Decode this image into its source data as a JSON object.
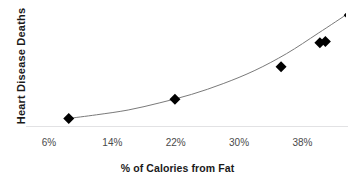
{
  "chart_data": {
    "type": "scatter",
    "title": "",
    "subtitle": "",
    "xlabel": "% of Calories from Fat",
    "ylabel": "Heart Disease Deaths",
    "xtick_labels": [
      "6%",
      "14%",
      "22%",
      "30%",
      "38%"
    ],
    "xtick_values": [
      6,
      14,
      22,
      30,
      38
    ],
    "ytick_labels": [],
    "xlim": [
      3.1,
      43.5
    ],
    "ylim": [
      0,
      100
    ],
    "grid": false,
    "legend": null,
    "legend_position": "none",
    "annotations": [],
    "series": [
      {
        "name": "Countries",
        "marker": "diamond",
        "marker_color": "#000000",
        "marker_size": 11,
        "x": [
          8.5,
          21.9,
          35.3,
          40.2,
          40.9,
          43.9
        ],
        "y": [
          8,
          24,
          51,
          71,
          72,
          94
        ]
      },
      {
        "name": "Fitted trend",
        "type": "line",
        "line_color": "#7a7a7a",
        "line_width": 1,
        "x": [
          8.5,
          12.0,
          16.0,
          20.0,
          24.0,
          28.0,
          32.0,
          36.0,
          40.0,
          43.9
        ],
        "y": [
          8,
          11,
          15,
          21,
          28,
          37,
          48,
          62,
          79,
          96
        ]
      }
    ]
  },
  "axes": {
    "x_title": "% of Calories from Fat",
    "y_title": "Heart Disease Deaths"
  },
  "colors": {
    "marker": "#000000",
    "curve": "#7a7a7a",
    "axis_line": "#e2e2e4",
    "tick_text": "#4a4a4a",
    "title_text": "#1a1a1a",
    "background": "#ffffff"
  }
}
